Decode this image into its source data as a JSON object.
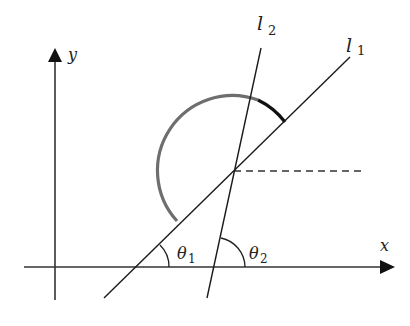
{
  "diagram": {
    "type": "geometry-figure",
    "axes": {
      "x_label": "x",
      "y_label": "y"
    },
    "lines": [
      {
        "id": "l1",
        "label_main": "l",
        "label_sub": "1"
      },
      {
        "id": "l2",
        "label_main": "l",
        "label_sub": "2"
      }
    ],
    "angles": [
      {
        "id": "theta1",
        "label_main": "θ",
        "label_sub": "1"
      },
      {
        "id": "theta2",
        "label_main": "θ",
        "label_sub": "2"
      }
    ],
    "colors": {
      "line": "#1a1a1a",
      "arc_gray": "#6e6e6e",
      "arc_dark": "#111111",
      "dashed": "#333333"
    }
  }
}
